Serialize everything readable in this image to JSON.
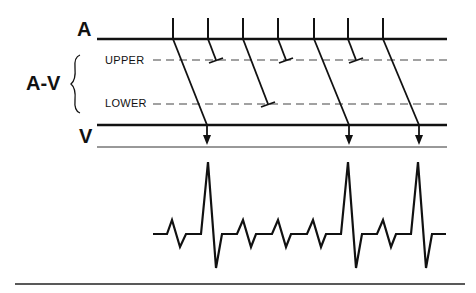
{
  "diagram": {
    "type": "ladder-diagram",
    "labels": {
      "atrium": "A",
      "av_node": "A-V",
      "upper": "UPPER",
      "lower": "LOWER",
      "ventricle": "V"
    },
    "colors": {
      "ink": "#111111",
      "dashed": "#444444",
      "background": "#ffffff"
    },
    "atrial_impulses_x": [
      173,
      208,
      243,
      278,
      314,
      348,
      383
    ],
    "conduction": [
      {
        "from_x": 173,
        "result": "conducted",
        "to_x": 207
      },
      {
        "from_x": 208,
        "result": "blocked-upper",
        "to_x": 216
      },
      {
        "from_x": 243,
        "result": "blocked-lower",
        "to_x": 268
      },
      {
        "from_x": 278,
        "result": "blocked-upper",
        "to_x": 286
      },
      {
        "from_x": 314,
        "result": "conducted",
        "to_x": 349
      },
      {
        "from_x": 348,
        "result": "blocked-upper",
        "to_x": 356
      },
      {
        "from_x": 383,
        "result": "conducted",
        "to_x": 419
      }
    ],
    "ecg": {
      "p_waves_x": [
        172,
        243,
        278,
        313
      ],
      "qrs_x": [
        208,
        348,
        418
      ]
    }
  }
}
